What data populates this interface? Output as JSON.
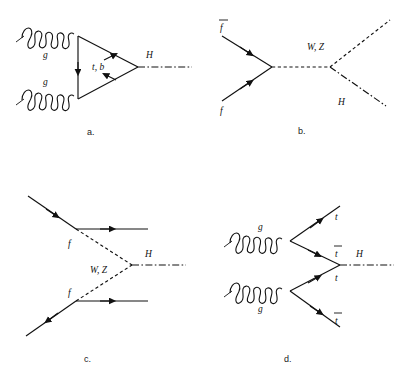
{
  "figure": {
    "background": "#ffffff",
    "line_color": "#111111",
    "width": 398,
    "height": 379
  },
  "diagrams": [
    {
      "id": "a",
      "caption": "a.",
      "name": "gluon-fusion",
      "labels": {
        "g_top": "g",
        "g_bottom": "g",
        "loop": "t, b",
        "higgs": "H"
      }
    },
    {
      "id": "b",
      "caption": "b.",
      "name": "associated-vector-boson-production",
      "labels": {
        "fbar": "f",
        "f": "f",
        "boson": "W, Z",
        "higgs": "H"
      }
    },
    {
      "id": "c",
      "caption": "c.",
      "name": "vector-boson-fusion",
      "labels": {
        "f_top": "f",
        "f_bottom": "f",
        "boson": "W, Z",
        "higgs": "H"
      }
    },
    {
      "id": "d",
      "caption": "d.",
      "name": "top-quark-associated-production",
      "labels": {
        "g_top": "g",
        "g_bottom": "g",
        "t_out_top": "t",
        "tbar_mid": "t",
        "t_mid": "t",
        "tbar_out_bottom": "t",
        "higgs": "H"
      }
    }
  ]
}
